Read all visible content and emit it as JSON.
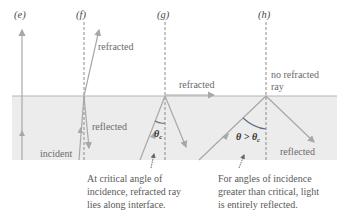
{
  "colors": {
    "medium": "#ececec",
    "interface": "#b5b5b5",
    "ray": "#a8a8a8",
    "normal": "#8a8a8a",
    "arc": "#5a6f86"
  },
  "panels": {
    "e": {
      "label": "(e)"
    },
    "f": {
      "label": "(f)",
      "refracted": "refracted",
      "reflected": "reflected",
      "incident": "incident"
    },
    "g": {
      "label": "(g)",
      "refracted": "refracted",
      "angle": "θc",
      "caption": [
        "At critical angle of",
        "incidence, refracted ray",
        "lies along interface."
      ]
    },
    "h": {
      "label": "(h)",
      "no_refracted": [
        "no refracted",
        "ray"
      ],
      "angle": "θ > θc",
      "reflected": "reflected",
      "caption": [
        "For angles of incidence",
        "greater than critical, light",
        "is entirely reflected."
      ]
    }
  }
}
